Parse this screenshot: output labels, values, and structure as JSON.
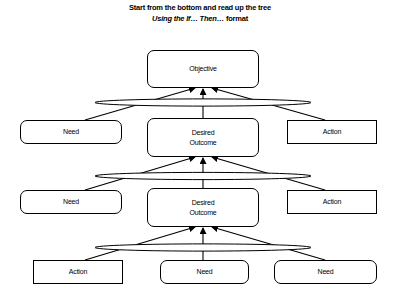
{
  "title": {
    "line1": "Start from the bottom and read up the tree",
    "line2_italic": "Using the If… Then…",
    "line2_rest": " format"
  },
  "nodes": {
    "objective": {
      "label": "Objective",
      "shape": "rounded"
    },
    "level1": {
      "left": {
        "label": "Need",
        "shape": "rounded"
      },
      "center": {
        "label_line1": "Desired",
        "label_line2": "Outcome",
        "shape": "rounded"
      },
      "right": {
        "label": "Action",
        "shape": "square"
      }
    },
    "level2": {
      "left": {
        "label": "Need",
        "shape": "rounded"
      },
      "center": {
        "label_line1": "Desired",
        "label_line2": "Outcome",
        "shape": "rounded"
      },
      "right": {
        "label": "Action",
        "shape": "square"
      }
    },
    "level3": {
      "left": {
        "label": "Action",
        "shape": "square"
      },
      "center": {
        "label": "Need",
        "shape": "rounded"
      },
      "right": {
        "label": "Need",
        "shape": "rounded"
      }
    }
  },
  "colors": {
    "stroke": "#000000",
    "background": "#ffffff"
  }
}
